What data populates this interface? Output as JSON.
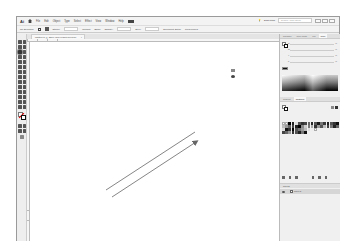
{
  "app": {
    "logo": "Ai",
    "home_icon": "home-icon"
  },
  "menu": {
    "items": [
      "File",
      "Edit",
      "Object",
      "Type",
      "Select",
      "Effect",
      "View",
      "Window",
      "Help"
    ],
    "workspace_switch_icon": "workspace-grid-icon",
    "workspace_name": "Essentials",
    "search_placeholder": "Search Adobe Stock"
  },
  "control_bar": {
    "selection_label": "No Selection",
    "stroke_label": "Stroke:",
    "stroke_value": "1 pt",
    "uniform_label": "Uniform",
    "basic_label": "Basic",
    "opacity_label": "Opacity:",
    "style_label": "Style:",
    "document_setup": "Document Setup",
    "preferences": "Preferences"
  },
  "document": {
    "tab_title": "Untitled-1* @ 150% (CMYK/GPU Preview)",
    "close_label": "×"
  },
  "canvas": {
    "lines": [
      {
        "x1": 76,
        "y1": 148,
        "x2": 165,
        "y2": 90,
        "stroke": "#666666",
        "arrow": false
      },
      {
        "x1": 82,
        "y1": 155,
        "x2": 168,
        "y2": 99,
        "stroke": "#666666",
        "arrow": true
      }
    ]
  },
  "panels": {
    "top_tabs": [
      "Navigator",
      "Color Guide",
      "Info",
      "Color"
    ],
    "active_top_tab": "Color",
    "color_sliders": [
      {
        "label": "C",
        "unit": "%"
      },
      {
        "label": "M",
        "unit": "%"
      },
      {
        "label": "Y",
        "unit": "%"
      },
      {
        "label": "K",
        "unit": "%"
      }
    ],
    "mid_tabs": [
      "Gradient",
      "Swatches"
    ],
    "active_mid_tab": "Swatches",
    "layers_tab": "Layers",
    "layer_name": "Layer 1"
  },
  "colors": {
    "window_bg": "#f0f0f0",
    "canvas_bg": "#ffffff",
    "line_color": "#666666",
    "panel_tab_active": "#f8f8f8"
  }
}
